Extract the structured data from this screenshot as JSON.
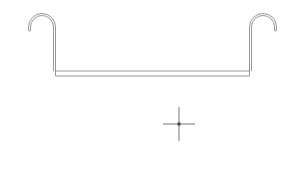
{
  "canvas": {
    "width": 304,
    "height": 185,
    "background": "#ffffff",
    "stroke_color": "#8a8a8a",
    "cursor_color": "#555555"
  },
  "drawing": {
    "shape": "hanger-bracket",
    "left_hook": {
      "post_x": 56,
      "arc_center_x": 42,
      "arc_center_y": 27,
      "arc_radius": 14,
      "tip_y": 29
    },
    "right_hook": {
      "post_x": 249,
      "arc_center_x": 263,
      "arc_center_y": 27,
      "arc_radius": 14,
      "tip_y": 29
    },
    "bar": {
      "x1": 56,
      "x2": 249,
      "y_top": 71,
      "y_bottom": 76
    }
  },
  "cursor": {
    "type": "crosshair",
    "x": 179,
    "y": 124,
    "h_extent": 16,
    "v_extent": 17
  }
}
